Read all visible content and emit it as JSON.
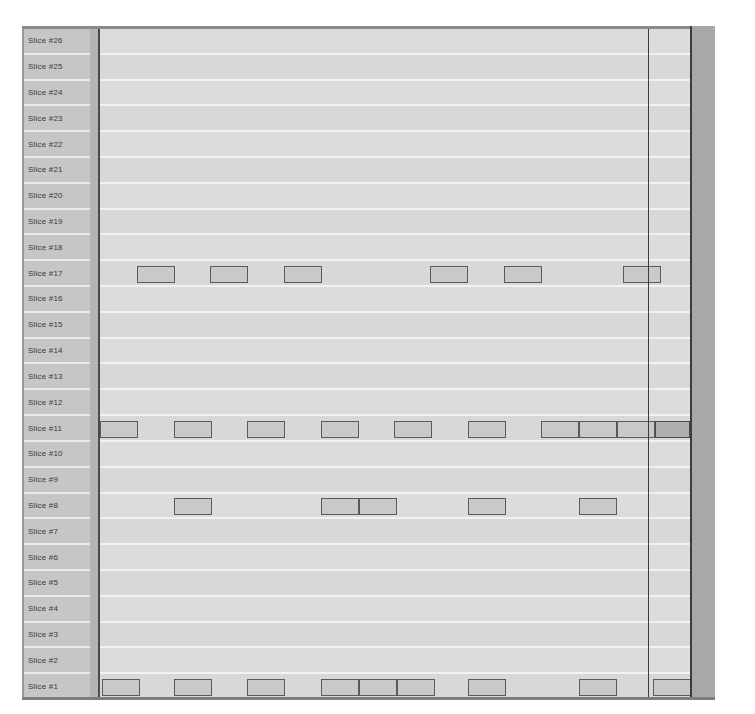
{
  "chart_data": {
    "type": "bar",
    "title": "",
    "xlabel": "",
    "ylabel": "",
    "grid": true,
    "legend": "none",
    "categories": [
      "Slice #1",
      "Slice #2",
      "Slice #3",
      "Slice #4",
      "Slice #5",
      "Slice #6",
      "Slice #7",
      "Slice #8",
      "Slice #9",
      "Slice #10",
      "Slice #11",
      "Slice #12",
      "Slice #13",
      "Slice #14",
      "Slice #15",
      "Slice #16",
      "Slice #17",
      "Slice #18",
      "Slice #19",
      "Slice #20",
      "Slice #21",
      "Slice #22",
      "Slice #23",
      "Slice #24",
      "Slice #25",
      "Slice #26"
    ],
    "row_count": 26,
    "rows": [
      {
        "label": "Slice #26",
        "blocks": []
      },
      {
        "label": "Slice #25",
        "blocks": []
      },
      {
        "label": "Slice #24",
        "blocks": []
      },
      {
        "label": "Slice #23",
        "blocks": []
      },
      {
        "label": "Slice #22",
        "blocks": []
      },
      {
        "label": "Slice #21",
        "blocks": []
      },
      {
        "label": "Slice #20",
        "blocks": []
      },
      {
        "label": "Slice #19",
        "blocks": []
      },
      {
        "label": "Slice #18",
        "blocks": []
      },
      {
        "label": "Slice #17",
        "blocks": [
          {
            "start": 37,
            "width": 38,
            "shade": "light"
          },
          {
            "start": 110,
            "width": 38,
            "shade": "light"
          },
          {
            "start": 184,
            "width": 38,
            "shade": "light"
          },
          {
            "start": 330,
            "width": 38,
            "shade": "light"
          },
          {
            "start": 404,
            "width": 38,
            "shade": "light"
          },
          {
            "start": 523,
            "width": 38,
            "shade": "light"
          }
        ]
      },
      {
        "label": "Slice #16",
        "blocks": []
      },
      {
        "label": "Slice #15",
        "blocks": []
      },
      {
        "label": "Slice #14",
        "blocks": []
      },
      {
        "label": "Slice #13",
        "blocks": []
      },
      {
        "label": "Slice #12",
        "blocks": []
      },
      {
        "label": "Slice #11",
        "blocks": [
          {
            "start": 0,
            "width": 38,
            "shade": "light"
          },
          {
            "start": 74,
            "width": 38,
            "shade": "light"
          },
          {
            "start": 147,
            "width": 38,
            "shade": "light"
          },
          {
            "start": 221,
            "width": 38,
            "shade": "light"
          },
          {
            "start": 294,
            "width": 38,
            "shade": "light"
          },
          {
            "start": 368,
            "width": 38,
            "shade": "light"
          },
          {
            "start": 441,
            "width": 38,
            "shade": "light"
          },
          {
            "start": 479,
            "width": 38,
            "shade": "light"
          },
          {
            "start": 517,
            "width": 38,
            "shade": "light"
          },
          {
            "start": 555,
            "width": 35,
            "shade": "dark"
          }
        ]
      },
      {
        "label": "Slice #10",
        "blocks": []
      },
      {
        "label": "Slice #9",
        "blocks": []
      },
      {
        "label": "Slice #8",
        "blocks": [
          {
            "start": 74,
            "width": 38,
            "shade": "light"
          },
          {
            "start": 221,
            "width": 38,
            "shade": "light"
          },
          {
            "start": 259,
            "width": 38,
            "shade": "light"
          },
          {
            "start": 368,
            "width": 38,
            "shade": "light"
          },
          {
            "start": 479,
            "width": 38,
            "shade": "light"
          }
        ]
      },
      {
        "label": "Slice #7",
        "blocks": []
      },
      {
        "label": "Slice #6",
        "blocks": []
      },
      {
        "label": "Slice #5",
        "blocks": []
      },
      {
        "label": "Slice #4",
        "blocks": []
      },
      {
        "label": "Slice #3",
        "blocks": []
      },
      {
        "label": "Slice #2",
        "blocks": []
      },
      {
        "label": "Slice #1",
        "blocks": [
          {
            "start": 2,
            "width": 38,
            "shade": "light"
          },
          {
            "start": 74,
            "width": 38,
            "shade": "light"
          },
          {
            "start": 147,
            "width": 38,
            "shade": "light"
          },
          {
            "start": 221,
            "width": 38,
            "shade": "light"
          },
          {
            "start": 259,
            "width": 38,
            "shade": "light"
          },
          {
            "start": 297,
            "width": 38,
            "shade": "light"
          },
          {
            "start": 368,
            "width": 38,
            "shade": "light"
          },
          {
            "start": 479,
            "width": 38,
            "shade": "light"
          },
          {
            "start": 553,
            "width": 38,
            "shade": "light"
          }
        ]
      }
    ],
    "marker_line_x": 548,
    "colors": {
      "plot_background": "#dcdcdc",
      "row_alt_background": "#d8d8d8",
      "gridline": "#f2f2f2",
      "label_column": "#c6c6c6",
      "gutter": "#b5b5b5",
      "right_band": "#a8a8a8",
      "block_fill": "#c9c9c9",
      "block_fill_dark": "#b0b0b0",
      "block_border": "#5a5a5a",
      "frame": "#7d7d7d",
      "marker_line": "#3c3c3c"
    }
  }
}
